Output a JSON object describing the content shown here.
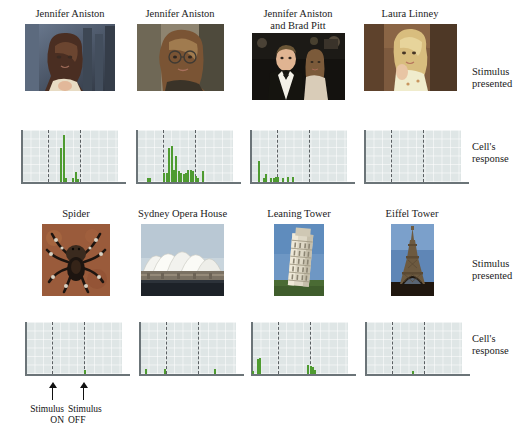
{
  "figure": {
    "side_labels": [
      {
        "text": "Stimulus\npresented",
        "row": 1
      },
      {
        "text": "Cell's\nresponse",
        "row": 1
      },
      {
        "text": "Stimulus\npresented",
        "row": 2
      },
      {
        "text": "Cell's\nresponse",
        "row": 2
      }
    ],
    "annotations": {
      "stimulus_on": "Stimulus\nON",
      "stimulus_off": "Stimulus\nOFF"
    },
    "colors": {
      "bar_fill": "#8cc63f",
      "bar_stroke": "#4e9b30",
      "panel_bg": "#dfe6e6",
      "axis": "#6b7478",
      "marker": "#5a5f62",
      "text": "#1b1b1b"
    }
  },
  "chart_data": {
    "type": "bar",
    "title": "",
    "xlabel": "Time",
    "ylabel": "Spike count",
    "grid": true,
    "legend": "none",
    "xlim": [
      0,
      40
    ],
    "ylim": [
      0,
      10
    ],
    "markers": {
      "stimulus_on_bin": 11,
      "stimulus_off_bin": 24
    },
    "panels": [
      {
        "stimulus": "Jennifer Aniston",
        "image": "jennifer-aniston-photo-1",
        "row": 1,
        "column": 1,
        "values": [
          0,
          0,
          0,
          0,
          0,
          0,
          0,
          0,
          0,
          0,
          0,
          0,
          0,
          0,
          0,
          0,
          6.5,
          9,
          0.7,
          0,
          0,
          0.7,
          2,
          0.6,
          0,
          0,
          0,
          0,
          0,
          0,
          0,
          0,
          0,
          0,
          0,
          0,
          0,
          0,
          0,
          0
        ]
      },
      {
        "stimulus": "Jennifer Aniston",
        "image": "jennifer-aniston-photo-2",
        "row": 1,
        "column": 2,
        "values": [
          0,
          0,
          0,
          0,
          0.7,
          0.7,
          0,
          0,
          0,
          0,
          0,
          1.7,
          1.8,
          6.5,
          7,
          2.4,
          5,
          2.2,
          1.7,
          1.6,
          1.7,
          2.3,
          2.4,
          2.2,
          1.2,
          0.7,
          0,
          2.2,
          0,
          0,
          0,
          0,
          0,
          0,
          0,
          0,
          0,
          0,
          0,
          0
        ]
      },
      {
        "stimulus": "Jennifer Aniston and Brad Pitt",
        "image": "jennifer-aniston-and-brad-pitt-photo",
        "row": 1,
        "column": 3,
        "values": [
          0,
          0,
          0,
          4,
          0,
          0.8,
          1.5,
          0,
          0.8,
          0.8,
          0.9,
          0.9,
          0,
          0.7,
          0,
          1,
          0,
          0.9,
          0,
          0,
          0,
          0,
          0,
          0,
          0,
          0,
          0,
          0,
          0,
          0,
          0,
          0,
          0,
          0,
          0,
          0,
          0,
          0,
          0,
          0
        ]
      },
      {
        "stimulus": "Laura Linney",
        "image": "laura-linney-photo",
        "row": 1,
        "column": 4,
        "values": [
          0,
          0,
          0,
          0,
          0,
          0,
          0,
          0,
          0,
          0,
          0,
          0,
          0,
          0,
          0,
          0,
          0,
          0,
          0,
          0,
          0,
          0,
          0,
          0,
          0,
          0,
          0,
          0,
          0,
          0,
          0,
          0,
          0,
          0,
          0,
          0,
          0,
          0,
          0,
          0
        ]
      },
      {
        "stimulus": "Spider",
        "image": "spider-photo",
        "row": 2,
        "column": 1,
        "values": [
          0,
          0,
          0,
          0,
          0,
          0,
          0,
          0,
          0,
          0,
          0,
          0,
          0,
          0,
          0,
          0,
          0,
          0,
          0,
          0,
          0,
          0,
          0,
          0,
          0.8,
          0,
          0,
          0,
          0,
          0,
          0,
          0,
          0,
          0,
          0,
          0,
          0,
          0,
          0,
          0
        ]
      },
      {
        "stimulus": "Sydney Opera House",
        "image": "sydney-opera-house-photo",
        "row": 2,
        "column": 2,
        "values": [
          0,
          0,
          1,
          0,
          0,
          0,
          0,
          0,
          0,
          0,
          0.9,
          0,
          0,
          0,
          0,
          0,
          0,
          0,
          0,
          0,
          0,
          0,
          0,
          0,
          0,
          0,
          0,
          0,
          0,
          0,
          0,
          0.9,
          0,
          0,
          0,
          0,
          0,
          0,
          0,
          0
        ]
      },
      {
        "stimulus": "Leaning Tower",
        "image": "leaning-tower-of-pisa-photo",
        "row": 2,
        "column": 3,
        "values": [
          0.6,
          0,
          2.8,
          3,
          0,
          0,
          0,
          0,
          0,
          0,
          0,
          0,
          0,
          0,
          0,
          0,
          0,
          0,
          0,
          0,
          0,
          0,
          0,
          1.7,
          1.6,
          1.4,
          0.8,
          0,
          0,
          0,
          0,
          0,
          0,
          0,
          0,
          0,
          0,
          0,
          0,
          0
        ]
      },
      {
        "stimulus": "Eiffel Tower",
        "image": "eiffel-tower-photo",
        "row": 2,
        "column": 4,
        "values": [
          0,
          0,
          0,
          0,
          0,
          0,
          0,
          0,
          0,
          0,
          0,
          0,
          0,
          0,
          0,
          0,
          0,
          0,
          0,
          0.6,
          0,
          0,
          0,
          0,
          0,
          0,
          0,
          0,
          0,
          0,
          0,
          0,
          0,
          0,
          0,
          0,
          0,
          0,
          0,
          0
        ]
      }
    ]
  },
  "stimuli": [
    {
      "label": "Jennifer Aniston",
      "x": 22,
      "y": 8,
      "w": 96,
      "img_x": 22,
      "img_y": 35,
      "img_w": 90,
      "img_h": 67
    },
    {
      "label": "Jennifer Aniston",
      "x": 133,
      "y": 8,
      "w": 96,
      "img_x": 136,
      "img_y": 35,
      "img_w": 87,
      "img_h": 67
    },
    {
      "label": "Jennifer Aniston\nand Brad Pitt",
      "x": 249,
      "y": 8,
      "w": 100,
      "img_x": 252,
      "img_y": 35,
      "img_w": 93,
      "img_h": 67
    },
    {
      "label": "Laura Linney",
      "x": 362,
      "y": 8,
      "w": 100,
      "img_x": 363,
      "img_y": 35,
      "img_w": 93,
      "img_h": 67
    },
    {
      "label": "Spider",
      "x": 22,
      "y": 208,
      "w": 96,
      "img_x": 42,
      "img_y": 233,
      "img_w": 68,
      "img_h": 72
    },
    {
      "label": "Sydney Opera House",
      "x": 125,
      "y": 208,
      "w": 112,
      "img_x": 141,
      "img_y": 233,
      "img_w": 83,
      "img_h": 72
    },
    {
      "label": "Leaning Tower",
      "x": 249,
      "y": 208,
      "w": 100,
      "img_x": 275,
      "img_y": 233,
      "img_w": 50,
      "img_h": 72
    },
    {
      "label": "Eiffel Tower",
      "x": 362,
      "y": 208,
      "w": 100,
      "img_x": 390,
      "img_y": 233,
      "img_w": 43,
      "img_h": 72
    }
  ]
}
